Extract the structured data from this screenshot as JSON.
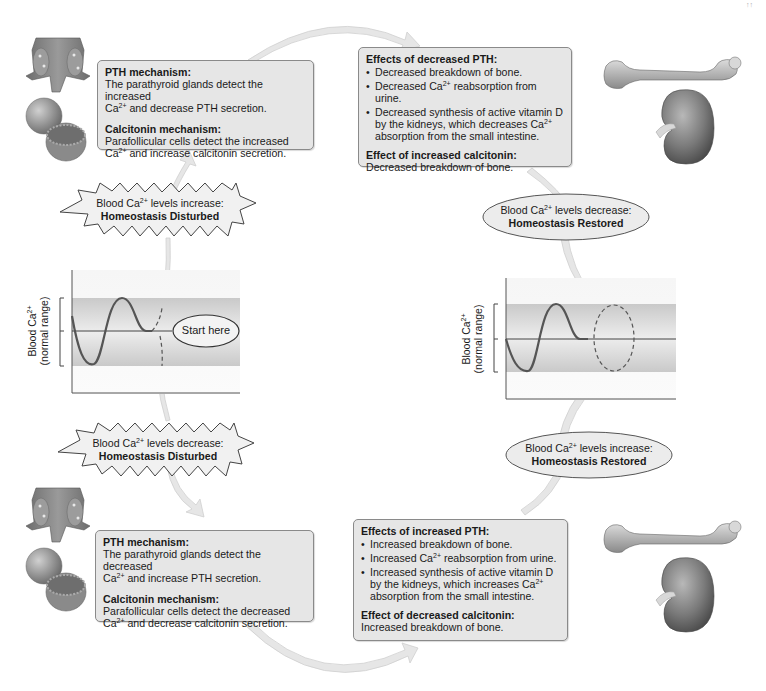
{
  "diagram": {
    "page_marker": "↑↑",
    "colors": {
      "box_fill": "#e6e6e6",
      "box_border": "#8a8a8a",
      "arrow_fill": "#e8e8e8",
      "band_fill": "#cfcfcf",
      "curve_stroke": "#555555"
    },
    "top_left_box": {
      "pth_heading": "PTH mechanism:",
      "pth_text_1": "The parathyroid glands detect the increased",
      "pth_text_2_pre": "Ca",
      "pth_text_2_sup": "2+",
      "pth_text_2_post": " and decrease PTH secretion.",
      "calc_heading": "Calcitonin mechanism:",
      "calc_text_1": "Parafollicular cells detect the increased",
      "calc_text_2_pre": "Ca",
      "calc_text_2_sup": "2+",
      "calc_text_2_post": " and increase calcitonin secretion."
    },
    "top_right_box": {
      "heading": "Effects of decreased PTH:",
      "bullets": [
        {
          "pre": "Decreased breakdown of bone.",
          "sup": "",
          "post": ""
        },
        {
          "pre": "Decreased Ca",
          "sup": "2+",
          "post": " reabsorption from urine."
        },
        {
          "pre": "Decreased synthesis of active vitamin D by the kidneys, which decreases Ca",
          "sup": "2+",
          "post": " absorption from the small intestine."
        }
      ],
      "calc_heading": "Effect of increased calcitonin:",
      "calc_text": "Decreased breakdown of bone."
    },
    "bottom_left_box": {
      "pth_heading": "PTH mechanism:",
      "pth_text_1": "The parathyroid glands detect the decreased",
      "pth_text_2_pre": "Ca",
      "pth_text_2_sup": "2+",
      "pth_text_2_post": " and increase PTH secretion.",
      "calc_heading": "Calcitonin mechanism:",
      "calc_text_1": "Parafollicular cells detect the decreased",
      "calc_text_2_pre": "Ca",
      "calc_text_2_sup": "2+",
      "calc_text_2_post": " and decrease calcitonin secretion."
    },
    "bottom_right_box": {
      "heading": "Effects of increased PTH:",
      "bullets": [
        {
          "pre": "Increased breakdown of bone.",
          "sup": "",
          "post": ""
        },
        {
          "pre": "Increased Ca",
          "sup": "2+",
          "post": " reabsorption from urine."
        },
        {
          "pre": "Increased synthesis of active vitamin D by the kidneys, which increases Ca",
          "sup": "2+",
          "post": " absorption from the small intestine."
        }
      ],
      "calc_heading": "Effect of decreased calcitonin:",
      "calc_text": "Increased breakdown of bone."
    },
    "starburst_top": {
      "line1_pre": "Blood Ca",
      "line1_sup": "2+",
      "line1_post": " levels increase:",
      "line2": "Homeostasis Disturbed"
    },
    "starburst_bottom": {
      "line1_pre": "Blood Ca",
      "line1_sup": "2+",
      "line1_post": " levels decrease:",
      "line2": "Homeostasis Disturbed"
    },
    "oval_top_right": {
      "line1_pre": "Blood Ca",
      "line1_sup": "2+",
      "line1_post": " levels decrease:",
      "line2": "Homeostasis Restored"
    },
    "oval_bottom_right": {
      "line1_pre": "Blood Ca",
      "line1_sup": "2+",
      "line1_post": " levels increase:",
      "line2": "Homeostasis Restored"
    },
    "graph_left": {
      "ylabel_1_pre": "Blood Ca",
      "ylabel_1_sup": "2+",
      "ylabel_2": "(normal range)",
      "start_label": "Start here"
    },
    "graph_right": {
      "ylabel_1_pre": "Blood Ca",
      "ylabel_1_sup": "2+",
      "ylabel_2": "(normal range)"
    },
    "illustrations": [
      {
        "name": "parathyroid-glands",
        "position": "top-left"
      },
      {
        "name": "thyroid-follicle",
        "position": "top-left"
      },
      {
        "name": "femur-bone",
        "position": "top-right"
      },
      {
        "name": "kidney",
        "position": "top-right"
      },
      {
        "name": "parathyroid-glands",
        "position": "bottom-left"
      },
      {
        "name": "thyroid-follicle",
        "position": "bottom-left"
      },
      {
        "name": "femur-bone",
        "position": "bottom-right"
      },
      {
        "name": "kidney",
        "position": "bottom-right"
      }
    ]
  }
}
